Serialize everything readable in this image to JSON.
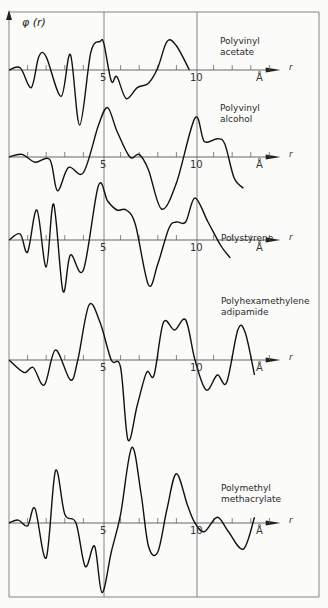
{
  "chart_data": {
    "type": "line",
    "title": "",
    "ylabel": "φ (r)",
    "xlabel": "r",
    "x_unit": "Å",
    "x_ticks": [
      5,
      10
    ],
    "x_range": [
      0,
      15
    ],
    "grid": false,
    "layout": "stacked panels, shared vertical lines at r=5 and r=10",
    "series": [
      {
        "name": "Polyvinyl acetate",
        "label_lines": [
          "Polyvinyl",
          "acetate"
        ],
        "x": [
          0,
          0.6,
          1.2,
          1.6,
          2.0,
          2.8,
          3.3,
          3.8,
          4.4,
          4.9,
          5.1,
          5.5,
          5.8,
          6.3,
          6.9,
          7.5,
          8.0,
          8.5,
          9.0,
          9.7
        ],
        "y": [
          0,
          0.1,
          -0.8,
          0.6,
          0.6,
          -1.2,
          0.7,
          -2.5,
          0.8,
          1.3,
          1.2,
          -0.5,
          -0.3,
          -1.3,
          -0.8,
          -0.6,
          0.1,
          1.3,
          1.1,
          0.0
        ]
      },
      {
        "name": "Polyvinyl alcohol",
        "label_lines": [
          "Polyvinyl",
          "alcohol"
        ],
        "x": [
          0,
          0.7,
          1.4,
          2.2,
          2.6,
          3.2,
          4.0,
          4.8,
          5.3,
          5.8,
          6.5,
          7.0,
          7.5,
          8.2,
          9.0,
          10.0,
          10.5,
          11.2,
          11.6,
          12.1,
          12.6
        ],
        "y": [
          0,
          0.1,
          -0.2,
          -0.1,
          -1.3,
          -0.4,
          -0.6,
          1.2,
          1.9,
          1.0,
          0.0,
          0.1,
          -0.5,
          -2.0,
          -1.0,
          1.5,
          0.6,
          0.7,
          0.5,
          -0.8,
          -1.2
        ]
      },
      {
        "name": "Polystyrene",
        "label_lines": [
          "Polystyrene"
        ],
        "x": [
          0,
          0.6,
          1.0,
          1.5,
          2.0,
          2.4,
          2.9,
          3.3,
          4.0,
          4.8,
          5.3,
          5.8,
          6.3,
          6.8,
          7.5,
          8.0,
          8.6,
          9.0,
          9.5,
          10.0,
          10.7,
          11.4,
          11.9
        ],
        "y": [
          0,
          0.2,
          -0.4,
          1.0,
          -0.9,
          1.2,
          -1.7,
          -0.5,
          -1.0,
          1.8,
          1.3,
          1.0,
          1.0,
          0.5,
          -1.5,
          -0.8,
          0.4,
          0.6,
          0.6,
          1.4,
          0.6,
          -0.2,
          -0.6
        ]
      },
      {
        "name": "Polyhexamethylene adipamide",
        "label_lines": [
          "Polyhexamethylene",
          "adipamide"
        ],
        "x": [
          0,
          0.8,
          1.3,
          1.9,
          2.5,
          3.3,
          3.7,
          4.3,
          4.9,
          5.5,
          6.0,
          6.4,
          6.9,
          7.4,
          7.8,
          8.3,
          8.9,
          9.5,
          10.0,
          10.6,
          11.2,
          11.7,
          12.3,
          12.7,
          13.2
        ],
        "y": [
          0,
          -0.5,
          -0.3,
          -1.0,
          0.4,
          -0.8,
          0.0,
          2.2,
          1.5,
          0.0,
          -0.3,
          -3.2,
          -1.8,
          -0.5,
          -0.6,
          1.5,
          1.2,
          1.6,
          0.0,
          -1.2,
          -0.6,
          -0.9,
          1.2,
          1.1,
          -0.6
        ]
      },
      {
        "name": "Polymethyl methacrylate",
        "label_lines": [
          "Polymethyl",
          "methacrylate"
        ],
        "x": [
          0,
          0.5,
          1.0,
          1.4,
          2.0,
          2.5,
          3.0,
          3.6,
          4.1,
          4.6,
          5.0,
          5.5,
          6.0,
          6.6,
          7.1,
          7.5,
          8.0,
          8.5,
          9.0,
          9.6,
          10.0,
          10.5,
          11.2,
          11.8,
          12.6,
          13.2
        ],
        "y": [
          0,
          0.1,
          -0.1,
          0.5,
          -1.2,
          1.8,
          0.3,
          0.0,
          -1.5,
          -0.8,
          -2.4,
          -1.0,
          0.3,
          2.6,
          1.0,
          -0.8,
          -1.0,
          0.5,
          1.7,
          0.6,
          0.0,
          -0.3,
          0.2,
          -0.3,
          -0.9,
          0.2
        ]
      }
    ]
  },
  "labels": {
    "ylabel": "φ (r)",
    "tick5": "5",
    "tick10": "10",
    "unit": "Å",
    "axis_r": "r",
    "s0_l1": "Polyvinyl",
    "s0_l2": "acetate",
    "s1_l1": "Polyvinyl",
    "s1_l2": "alcohol",
    "s2_l1": "Polystyrene",
    "s3_l1": "Polyhexamethylene",
    "s3_l2": "adipamide",
    "s4_l1": "Polymethyl",
    "s4_l2": "methacrylate"
  }
}
